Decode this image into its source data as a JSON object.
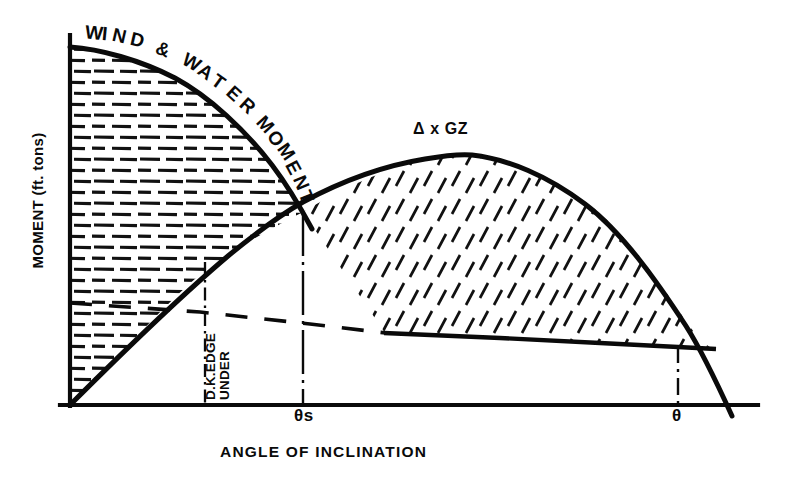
{
  "figure": {
    "background_color": "#ffffff",
    "ink_color": "#0a0a0a"
  },
  "axes": {
    "y_title": "MOMENT (ft. tons)",
    "x_title": "ANGLE OF INCLINATION",
    "origin_px": [
      70,
      405
    ],
    "x_axis_end_px": [
      758,
      405
    ],
    "y_axis_top_px": [
      70,
      35
    ]
  },
  "annotations": {
    "wind_water_label": "WIND & WATER MOMENT",
    "gz_label": "Δ x GZ",
    "deck_edge_line1": "D.K.EDGE",
    "deck_edge_line2": "UNDER",
    "theta_s": "θs",
    "theta": "θ"
  },
  "markers": {
    "theta_s_x_px": 303,
    "theta_x_px": 678,
    "deck_edge_x_px": 205,
    "intersection_px": [
      303,
      212
    ]
  },
  "chart_data": {
    "type": "line",
    "xlabel": "ANGLE OF INCLINATION",
    "ylabel": "MOMENT (ft. tons)",
    "grid": false,
    "legend": "inline-annotations",
    "axis_ranges": {
      "x_px": [
        70,
        758
      ],
      "y_px": [
        405,
        35
      ]
    },
    "series": [
      {
        "name": "WIND & WATER MOMENT",
        "style": "solid-thick-curve",
        "hatch": "horizontal-dashes",
        "points_px": [
          [
            70,
            47
          ],
          [
            110,
            53
          ],
          [
            150,
            65
          ],
          [
            190,
            83
          ],
          [
            225,
            106
          ],
          [
            255,
            133
          ],
          [
            280,
            168
          ],
          [
            303,
            212
          ]
        ],
        "description": "Decreasing heeling moment curve from the y-axis, falling to meet the righting curve at theta-s"
      },
      {
        "name": "Δ x GZ",
        "style": "solid-thick-curve",
        "hatch": "diagonal-dashes",
        "points_px": [
          [
            70,
            405
          ],
          [
            130,
            341
          ],
          [
            190,
            282
          ],
          [
            250,
            240
          ],
          [
            303,
            212
          ],
          [
            350,
            186
          ],
          [
            400,
            167
          ],
          [
            465,
            155
          ],
          [
            520,
            163
          ],
          [
            570,
            185
          ],
          [
            620,
            225
          ],
          [
            665,
            285
          ],
          [
            700,
            348
          ],
          [
            718,
            386
          ],
          [
            730,
            412
          ]
        ],
        "description": "Righting moment curve rising from origin through theta-s, peaking then falling to zero at theta"
      },
      {
        "name": "residual-dashed-baseline",
        "style": "dashed",
        "points_px": [
          [
            70,
            303
          ],
          [
            200,
            312
          ],
          [
            310,
            324
          ],
          [
            385,
            333
          ]
        ],
        "description": "Dashed reference line continuing as the solid lower bound of the Delta x GZ area"
      },
      {
        "name": "residual-solid-baseline",
        "style": "solid",
        "points_px": [
          [
            385,
            333
          ],
          [
            500,
            338
          ],
          [
            600,
            343
          ],
          [
            678,
            347
          ],
          [
            715,
            349
          ]
        ],
        "description": "Solid lower bound of the shaded righting energy area"
      }
    ],
    "shaded_regions": [
      {
        "name": "wind-water-moment-area",
        "hatch": "horizontal-dashes",
        "bounded_by": [
          "y-axis",
          "WIND & WATER MOMENT curve",
          "Δ x GZ curve",
          "x-axis"
        ]
      },
      {
        "name": "righting-energy-area",
        "hatch": "diagonal-dashes",
        "bounded_by": [
          "Δ x GZ curve",
          "residual baseline",
          "theta"
        ]
      }
    ],
    "reference_lines": [
      {
        "name": "deck-edge-under",
        "type": "dash-dot-vertical",
        "x_px": 205,
        "from_y_px": 265,
        "to_y_px": 405
      },
      {
        "name": "theta-s",
        "type": "dash-dot-vertical",
        "x_px": 303,
        "from_y_px": 212,
        "to_y_px": 405
      },
      {
        "name": "theta",
        "type": "dash-dot-vertical",
        "x_px": 678,
        "from_y_px": 347,
        "to_y_px": 405
      }
    ]
  }
}
